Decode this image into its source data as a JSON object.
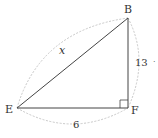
{
  "diagram": {
    "type": "right-triangle",
    "vertices": [
      {
        "name": "B",
        "label": "B"
      },
      {
        "name": "E",
        "label": "E"
      },
      {
        "name": "F",
        "label": "F"
      }
    ],
    "sides": {
      "hypotenuse_EB": {
        "label": "x"
      },
      "leg_BF": {
        "label": "13"
      },
      "leg_EF": {
        "label": "6"
      }
    },
    "right_angle_at": "F",
    "colors": {
      "line": "#444444",
      "arc": "#c8c8c8",
      "text": "#333333"
    },
    "extra_mark": "·"
  }
}
